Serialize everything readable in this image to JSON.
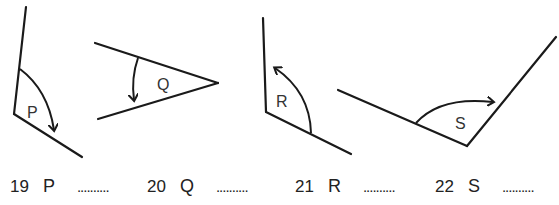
{
  "diagram": {
    "angles": [
      {
        "label": "P",
        "question": "19"
      },
      {
        "label": "Q",
        "question": "20"
      },
      {
        "label": "R",
        "question": "21"
      },
      {
        "label": "S",
        "question": "22"
      }
    ]
  },
  "answers": [
    {
      "number": "19",
      "letter": "P",
      "blank": ".........."
    },
    {
      "number": "20",
      "letter": "Q",
      "blank": ".........."
    },
    {
      "number": "21",
      "letter": "R",
      "blank": ".........."
    },
    {
      "number": "22",
      "letter": "S",
      "blank": ".........."
    }
  ]
}
